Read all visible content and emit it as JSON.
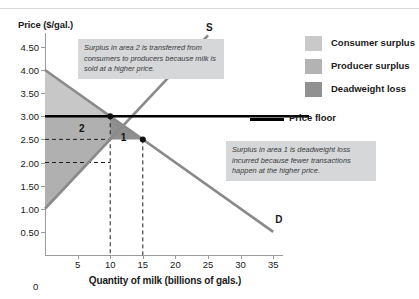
{
  "chart_data": {
    "type": "line",
    "title": "",
    "xlabel": "Quantity of milk (billions of gals.)",
    "ylabel": "Price ($/gal.)",
    "xlim": [
      0,
      36.5
    ],
    "ylim": [
      0,
      4.8
    ],
    "grid": false,
    "legend_position": "right",
    "x_ticks": [
      5,
      10,
      15,
      20,
      25,
      30,
      35
    ],
    "x_tick_labels": [
      "5",
      "10",
      "15",
      "20",
      "25",
      "30",
      "35"
    ],
    "x_origin_label": "0",
    "y_ticks": [
      0.5,
      1.0,
      1.5,
      2.0,
      2.5,
      3.0,
      3.5,
      4.0,
      4.5
    ],
    "y_tick_labels": [
      "0.50",
      "1.00",
      "1.50",
      "2.00",
      "2.50",
      "3.00",
      "3.50",
      "4.00",
      "4.50"
    ],
    "series": [
      {
        "name": "Demand",
        "label": "D",
        "type": "line",
        "color": "#8a8a8a",
        "points": [
          [
            0,
            4.0
          ],
          [
            35,
            0.5
          ]
        ]
      },
      {
        "name": "Supply",
        "label": "S",
        "type": "line",
        "color": "#8a8a8a",
        "points": [
          [
            0,
            1.0
          ],
          [
            25,
            4.75
          ]
        ]
      },
      {
        "name": "Price floor",
        "label": "Price floor",
        "type": "hline",
        "color": "#000000",
        "value": 3.0
      }
    ],
    "equilibrium": {
      "quantity": 15,
      "price": 2.5
    },
    "price_floor": {
      "price": 3.0,
      "quantity_demanded": 10,
      "quantity_supplied": 20
    },
    "marked_points": [
      {
        "x": 10,
        "y": 3.0,
        "on": "Demand"
      },
      {
        "x": 15,
        "y": 2.5,
        "on": "Equilibrium"
      }
    ],
    "reference_lines": [
      {
        "orientation": "vertical",
        "value": 10,
        "style": "dashed"
      },
      {
        "orientation": "vertical",
        "value": 15,
        "style": "dashed"
      },
      {
        "orientation": "horizontal",
        "value": 2.5,
        "style": "dashed"
      },
      {
        "orientation": "horizontal",
        "value": 2.0,
        "style": "dashed"
      }
    ],
    "shaded_regions": [
      {
        "name": "Consumer surplus",
        "color": "#c7c7c7",
        "description": "Triangle above price floor under demand curve"
      },
      {
        "name": "Producer surplus",
        "color": "#b0b0b0",
        "description": "Area above supply curve below price received"
      },
      {
        "name": "Deadweight loss",
        "color": "#8f8f8f",
        "description": "Triangle between Q=10 and Q=15 bounded by demand, supply and price floor"
      }
    ],
    "region_labels": [
      {
        "text": "2",
        "x": 5.2,
        "y": 2.73,
        "meaning": "Transfer from consumers to producers"
      },
      {
        "text": "1",
        "x": 11.6,
        "y": 2.52,
        "meaning": "Deadweight loss"
      }
    ],
    "annotations": [
      {
        "id": "note-area2",
        "text": "Surplus in area 2 is transferred from consumers to producers because milk is sold at a higher price."
      },
      {
        "id": "note-area1",
        "text": "Surplus in area 1 is deadweight loss incurred because fewer transactions happen at the higher price."
      }
    ]
  },
  "legend": {
    "items": [
      {
        "label": "Consumer surplus",
        "color": "#c9c9c9"
      },
      {
        "label": "Producer surplus",
        "color": "#b3b3b3"
      },
      {
        "label": "Deadweight loss",
        "color": "#919191"
      }
    ],
    "price_floor_label": "Price floor"
  }
}
